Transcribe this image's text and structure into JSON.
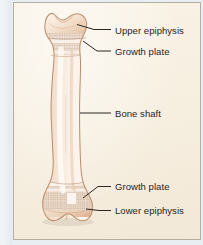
{
  "figure": {
    "panel_background_color": "#f7efe0",
    "panel_border_color": "#b4ada1",
    "label_text_color": "#26241f",
    "leader_line_color": "#2b2824",
    "bone_outline_color": "#c69a78",
    "bone_fill_light": "#fdf6ee",
    "bone_fill_shadow": "#e2bfa2",
    "trabecular_color": "#cbb8ac"
  },
  "labels": [
    {
      "id": "upper-epiphysis",
      "text": "Upper epiphysis",
      "x": 101,
      "y": 22
    },
    {
      "id": "growth-plate-upper",
      "text": "Growth plate",
      "x": 101,
      "y": 44
    },
    {
      "id": "bone-shaft",
      "text": "Bone shaft",
      "x": 101,
      "y": 106
    },
    {
      "id": "growth-plate-lower",
      "text": "Growth plate",
      "x": 101,
      "y": 179
    },
    {
      "id": "lower-epiphysis",
      "text": "Lower epiphysis",
      "x": 101,
      "y": 203
    }
  ],
  "parts": [
    {
      "id": "upper-epiphysis-region",
      "name": "Upper epiphysis"
    },
    {
      "id": "upper-growth-plate-region",
      "name": "Growth plate"
    },
    {
      "id": "shaft-region",
      "name": "Bone shaft"
    },
    {
      "id": "lower-growth-plate-region",
      "name": "Growth plate"
    },
    {
      "id": "lower-epiphysis-region",
      "name": "Lower epiphysis"
    }
  ]
}
